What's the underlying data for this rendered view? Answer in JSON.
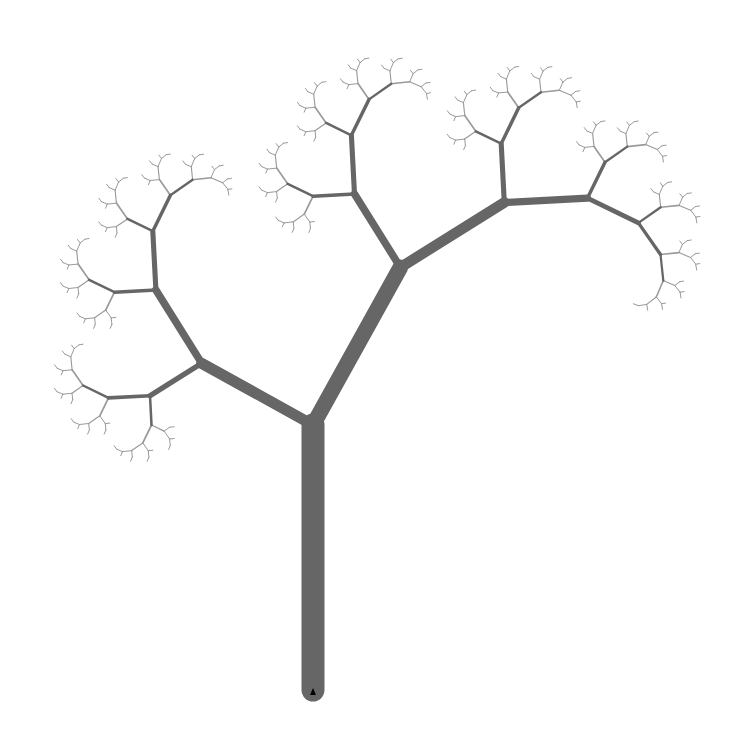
{
  "scene": {
    "type": "turtle-fractal-tree",
    "background": "#ffffff",
    "stroke_color": "#666666",
    "tip_color": "#9a9a9a",
    "origin": {
      "x": 313,
      "y": 690
    },
    "trunk_length": 265,
    "trunk_width": 23,
    "left_branch": {
      "turn_deg": 61,
      "scale": 0.48
    },
    "right_branch": {
      "turn_deg": -29,
      "scale": 0.68
    },
    "min_length": 4,
    "turtle_marker": {
      "x": 313,
      "y": 692,
      "color": "#000000"
    }
  }
}
